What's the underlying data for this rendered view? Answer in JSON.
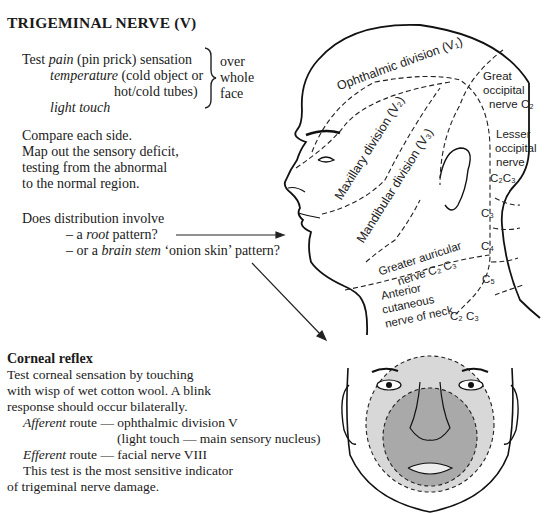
{
  "title": "TRIGEMINAL NERVE (V)",
  "test_block": {
    "line1_pre": "Test ",
    "line1_italic": "pain",
    "line1_post": " (pin prick) sensation",
    "line2_italic": "temperature",
    "line2_post": " (cold object or",
    "line3": "hot/cold tubes)",
    "line4_italic": "light touch",
    "brace_text": [
      "over",
      "whole",
      "face"
    ]
  },
  "compare_block": [
    "Compare each side.",
    "Map out the sensory deficit,",
    "testing from the abnormal",
    "to the normal region."
  ],
  "distribution_block": {
    "question": "Does distribution involve",
    "opt1_pre": "– a ",
    "opt1_italic": "root",
    "opt1_post": " pattern?",
    "opt2_pre": "– or a ",
    "opt2_italic": "brain stem",
    "opt2_post": " ‘onion skin’ pattern?"
  },
  "corneal": {
    "heading": "Corneal reflex",
    "lines": [
      "Test corneal sensation by touching",
      "with wisp of wet cotton wool. A blink",
      "response should occur bilaterally."
    ],
    "afferent_italic": "Afferent",
    "afferent_post": " route — ophthalmic division V",
    "afferent_cont": "(light touch — main sensory nucleus)",
    "efferent_italic": "Efferent",
    "efferent_post": " route — facial nerve VIII",
    "sensitive_1": "This test is the most sensitive indicator",
    "sensitive_2": "of trigeminal nerve damage."
  },
  "head_labels": {
    "v1": "Ophthalmic division (V₁)",
    "v2": "Maxillary division (V₂)",
    "v3": "Mandibular division (V₃)",
    "great_occ": [
      "Great",
      "occipital",
      "nerve C₂"
    ],
    "lesser_occ": [
      "Lesser",
      "occipital",
      "nerve",
      "C₂C₃"
    ],
    "c3": "C₃",
    "c4": "C₄",
    "c5": "C₅",
    "greater_aur": [
      "Greater auricular",
      "nerve C₂ C₃"
    ],
    "anterior": [
      "Anterior",
      "cutaneous",
      "nerve of neck",
      "C₂ C₃"
    ]
  }
}
